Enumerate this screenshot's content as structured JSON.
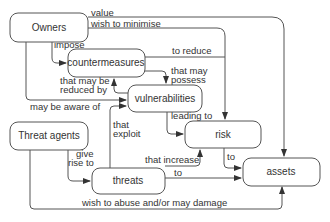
{
  "diagram": {
    "nodes": {
      "owners": "Owners",
      "countermeasures": "countermeasures",
      "vulnerabilities": "vulnerabilities",
      "threat_agents": "Threat agents",
      "risk": "risk",
      "threats": "threats",
      "assets": "assets"
    },
    "edges": {
      "value": "value",
      "wish_to_minimise": "wish to minimise",
      "impose": "impose",
      "to_reduce": "to reduce",
      "that_may_possess_1": "that may",
      "that_may_possess_2": "possess",
      "reduced_by_1": "that may be",
      "reduced_by_2": "reduced by",
      "may_be_aware_of": "may be aware of",
      "leading_to": "leading to",
      "that_exploit_1": "that",
      "that_exploit_2": "exploit",
      "give_rise_to_1": "give",
      "give_rise_to_2": "rise to",
      "that_increase": "that increase",
      "risk_to": "to",
      "threats_to": "to",
      "wish_to_abuse": "wish to abuse and/or may damage"
    }
  }
}
